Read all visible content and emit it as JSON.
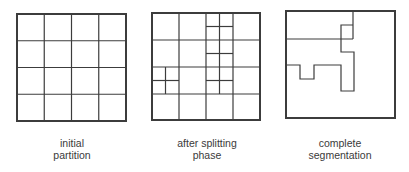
{
  "colors": {
    "background": "#ffffff",
    "stroke": "#3c3c3c",
    "text": "#3a3a3a"
  },
  "panels": [
    {
      "id": "initial-partition",
      "caption": [
        "initial",
        "partition"
      ],
      "box": {
        "x": 17,
        "y": 14,
        "w": 109,
        "h": 107
      },
      "caption_center_x": 72,
      "lines": [
        [
          44.25,
          14,
          44.25,
          121
        ],
        [
          71.5,
          14,
          71.5,
          121
        ],
        [
          98.75,
          14,
          98.75,
          121
        ],
        [
          17,
          40.75,
          126,
          40.75
        ],
        [
          17,
          67.5,
          126,
          67.5
        ],
        [
          17,
          94.25,
          126,
          94.25
        ]
      ]
    },
    {
      "id": "after-splitting-phase",
      "caption": [
        "after splitting",
        "phase"
      ],
      "box": {
        "x": 152,
        "y": 13,
        "w": 108,
        "h": 107
      },
      "caption_center_x": 207,
      "lines": [
        [
          179,
          13,
          179,
          120
        ],
        [
          206,
          13,
          206,
          120
        ],
        [
          233,
          13,
          233,
          120
        ],
        [
          152,
          40,
          260,
          40
        ],
        [
          152,
          67,
          260,
          67
        ],
        [
          152,
          94,
          260,
          94
        ],
        [
          219.5,
          13,
          219.5,
          94
        ],
        [
          206,
          26.5,
          233,
          26.5
        ],
        [
          206,
          53.5,
          233,
          53.5
        ],
        [
          206,
          80.5,
          233,
          80.5
        ],
        [
          165.5,
          67,
          165.5,
          94
        ],
        [
          152,
          80.5,
          179,
          80.5
        ]
      ]
    },
    {
      "id": "complete-segmentation",
      "caption": [
        "complete",
        "segmentation"
      ],
      "box": {
        "x": 286,
        "y": 11,
        "w": 109,
        "h": 107
      },
      "caption_center_x": 340,
      "polylines": [
        [
          [
            353,
            11
          ],
          [
            353,
            39
          ]
        ],
        [
          [
            286,
            39
          ],
          [
            353,
            39
          ]
        ],
        [
          [
            341,
            39
          ],
          [
            341,
            25
          ],
          [
            353,
            25
          ]
        ],
        [
          [
            341,
            39
          ],
          [
            341,
            52
          ],
          [
            354,
            52
          ],
          [
            354,
            91
          ],
          [
            341,
            91
          ],
          [
            341,
            65
          ],
          [
            314,
            65
          ],
          [
            314,
            79
          ],
          [
            300,
            79
          ],
          [
            300,
            65
          ],
          [
            286,
            65
          ]
        ]
      ]
    }
  ]
}
